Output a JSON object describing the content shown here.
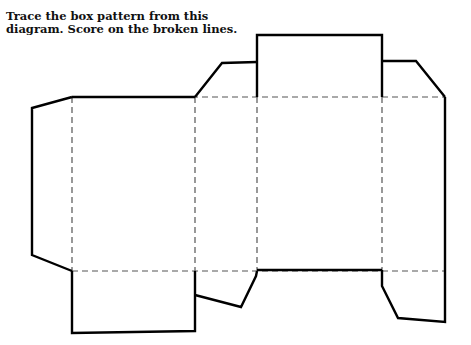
{
  "caption": {
    "line1": "Trace the box pattern from this",
    "line2": "diagram. Score on the broken lines."
  },
  "diagram": {
    "type": "box-net",
    "cut_line_color": "#000000",
    "score_line_color": "#555555",
    "legend": {
      "solid": "cut line",
      "dashed": "score line"
    }
  }
}
